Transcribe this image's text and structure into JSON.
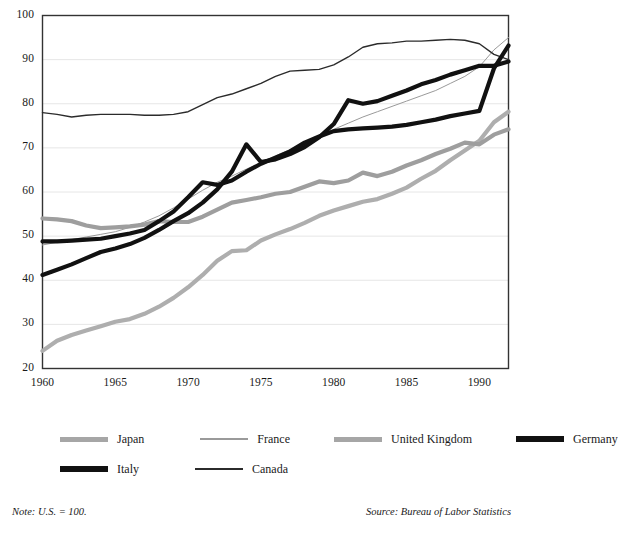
{
  "chart_data": {
    "type": "line",
    "title": "",
    "subtitle": "",
    "xlabel": "",
    "ylabel": "",
    "xlim": [
      1960,
      1992
    ],
    "ylim": [
      20,
      100
    ],
    "grid": "horizontal",
    "legend_position": "below",
    "note": "Note: U.S. = 100.",
    "source": "Source: Bureau of Labor Statistics",
    "yticks": [
      20,
      30,
      40,
      50,
      60,
      70,
      80,
      90,
      100
    ],
    "xticks": [
      1960,
      1965,
      1970,
      1975,
      1980,
      1985,
      1990
    ],
    "x": [
      1960,
      1961,
      1962,
      1963,
      1964,
      1965,
      1966,
      1967,
      1968,
      1969,
      1970,
      1971,
      1972,
      1973,
      1974,
      1975,
      1976,
      1977,
      1978,
      1979,
      1980,
      1981,
      1982,
      1983,
      1984,
      1985,
      1986,
      1987,
      1988,
      1989,
      1990,
      1991,
      1992
    ],
    "series": [
      {
        "name": "Japan",
        "color": "#aeaeae",
        "width": 4.2,
        "values": [
          24.0,
          26.3,
          27.6,
          28.6,
          29.6,
          30.6,
          31.2,
          32.4,
          34.0,
          36.0,
          38.4,
          41.2,
          44.4,
          46.6,
          46.8,
          49.0,
          50.4,
          51.6,
          53.0,
          54.6,
          55.8,
          56.8,
          57.8,
          58.4,
          59.6,
          61.0,
          63.0,
          64.8,
          67.2,
          69.4,
          71.6,
          75.8,
          78.2
        ]
      },
      {
        "name": "France",
        "color": "#9a9a9a",
        "width": 1.0,
        "values": [
          48.0,
          48.6,
          49.2,
          49.8,
          50.4,
          51.0,
          52.0,
          53.2,
          54.6,
          56.4,
          58.4,
          60.4,
          62.2,
          63.6,
          65.2,
          66.6,
          68.2,
          69.6,
          71.2,
          72.8,
          74.2,
          75.6,
          77.0,
          78.2,
          79.4,
          80.6,
          81.8,
          83.0,
          84.6,
          86.2,
          88.4,
          92.2,
          95.0
        ]
      },
      {
        "name": "United Kingdom",
        "color": "#9e9e9e",
        "width": 4.2,
        "values": [
          54.0,
          53.8,
          53.4,
          52.4,
          51.8,
          52.0,
          52.2,
          52.6,
          53.4,
          53.2,
          53.2,
          54.4,
          56.0,
          57.6,
          58.2,
          58.8,
          59.6,
          60.0,
          61.2,
          62.4,
          62.0,
          62.6,
          64.4,
          63.6,
          64.6,
          66.0,
          67.2,
          68.6,
          69.8,
          71.2,
          70.8,
          73.0,
          74.2
        ]
      },
      {
        "name": "Germany",
        "color": "#111111",
        "width": 4.2,
        "values": [
          48.8,
          48.8,
          49.0,
          49.2,
          49.4,
          50.0,
          50.6,
          51.4,
          53.4,
          55.6,
          58.8,
          62.2,
          61.6,
          62.6,
          64.6,
          66.4,
          67.8,
          69.2,
          71.2,
          72.6,
          73.8,
          74.2,
          74.4,
          74.6,
          74.8,
          75.2,
          75.8,
          76.4,
          77.2,
          77.8,
          78.4,
          88.0,
          93.2
        ]
      },
      {
        "name": "Italy",
        "color": "#111111",
        "width": 4.2,
        "values": [
          41.2,
          42.4,
          43.6,
          45.0,
          46.4,
          47.2,
          48.2,
          49.6,
          51.4,
          53.4,
          55.2,
          57.6,
          60.6,
          64.6,
          70.8,
          66.8,
          67.4,
          68.6,
          70.2,
          72.4,
          75.4,
          80.8,
          80.0,
          80.6,
          81.8,
          83.0,
          84.4,
          85.4,
          86.6,
          87.6,
          88.6,
          88.6,
          89.6
        ]
      },
      {
        "name": "Canada",
        "color": "#2b2b2b",
        "width": 1.4,
        "values": [
          78.0,
          77.6,
          77.0,
          77.4,
          77.6,
          77.6,
          77.6,
          77.4,
          77.4,
          77.6,
          78.2,
          79.8,
          81.4,
          82.2,
          83.4,
          84.6,
          86.2,
          87.4,
          87.6,
          87.8,
          88.8,
          90.6,
          92.8,
          93.6,
          93.8,
          94.2,
          94.2,
          94.4,
          94.6,
          94.4,
          93.6,
          91.2,
          90.0
        ]
      }
    ]
  },
  "axes": {
    "ytick_labels": [
      "100",
      "90",
      "80",
      "70",
      "60",
      "50",
      "40",
      "30",
      "20"
    ],
    "xtick_labels": [
      "1960",
      "1965",
      "1970",
      "1975",
      "1980",
      "1985",
      "1990"
    ]
  },
  "legend": {
    "rows": [
      [
        {
          "label": "Japan",
          "style": "thick-gray"
        },
        {
          "label": "France",
          "style": "thin-gray"
        },
        {
          "label": "United Kingdom",
          "style": "thick-gray"
        },
        {
          "label": "Germany",
          "style": "thick-black"
        }
      ],
      [
        {
          "label": "Italy",
          "style": "thick-black"
        },
        {
          "label": "Canada",
          "style": "thin-black"
        }
      ]
    ]
  },
  "footnotes": {
    "note": "Note: U.S. = 100.",
    "source": "Source: Bureau of Labor Statistics"
  }
}
